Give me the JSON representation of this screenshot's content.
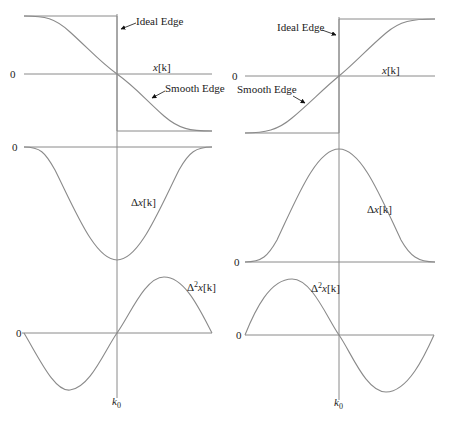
{
  "figure": {
    "left_column": {
      "edge_plot": {
        "zero_label": "0",
        "signal_label_main": "x",
        "signal_label_index": "[k]",
        "ideal_label": "Ideal Edge",
        "smooth_label": "Smooth Edge",
        "edge_direction": "falling"
      },
      "first_diff_plot": {
        "zero_label": "0",
        "label_delta": "Δ",
        "label_var": "x",
        "label_index": "[k]",
        "shape": "negative bell (minimum at k0)"
      },
      "second_diff_plot": {
        "zero_label": "0",
        "label_delta": "Δ",
        "label_exp": "2",
        "label_var": "x",
        "label_index": "[k]",
        "shape": "negative lobe then positive lobe, zero crossing at k0"
      },
      "k0_label": "k",
      "k0_sub": "0"
    },
    "right_column": {
      "edge_plot": {
        "zero_label": "0",
        "signal_label_main": "x",
        "signal_label_index": "[k]",
        "ideal_label": "Ideal Edge",
        "smooth_label": "Smooth Edge",
        "edge_direction": "rising"
      },
      "first_diff_plot": {
        "zero_label": "0",
        "label_delta": "Δ",
        "label_var": "x",
        "label_index": "[k]",
        "shape": "positive bell (maximum at k0)"
      },
      "second_diff_plot": {
        "zero_label": "0",
        "label_delta": "Δ",
        "label_exp": "2",
        "label_var": "x",
        "label_index": "[k]",
        "shape": "positive lobe then negative lobe, zero crossing at k0"
      },
      "k0_label": "k",
      "k0_sub": "0"
    }
  }
}
